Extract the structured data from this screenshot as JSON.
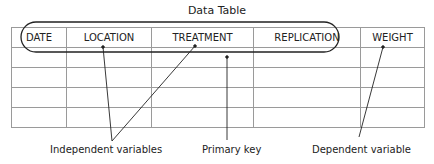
{
  "title": "Data Table",
  "columns": [
    "DATE",
    "LOCATION",
    "TREATMENT",
    "REPLICATION",
    "WEIGHT"
  ],
  "empty_rows": 4,
  "annotations": {
    "independent": "Independent variables",
    "primary_key": "Primary key",
    "dependent": "Dependent variable"
  }
}
